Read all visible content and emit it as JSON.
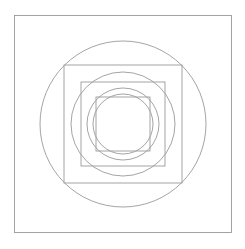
{
  "figure": {
    "background_color": "#ffffff",
    "stroke_color": "#9a9a9a",
    "stroke_width": 0.9,
    "canvas": {
      "width": 245,
      "height": 249
    },
    "center": {
      "x": 123,
      "y": 124
    }
  },
  "chart_data": {
    "type": "diagram",
    "xlabel": "",
    "ylabel": "",
    "grid": false,
    "legend": false,
    "center": {
      "x": 123,
      "y": 124
    },
    "shapes": [
      {
        "index": 1,
        "type": "square",
        "half_size": 108.5,
        "side": 217,
        "left": 14.5,
        "top": 15.5,
        "right": 231.5,
        "bottom": 232.5,
        "stroke": "#9a9a9a"
      },
      {
        "index": 2,
        "type": "circle",
        "radius": 83,
        "left": 40,
        "top": 41,
        "right": 206,
        "bottom": 207,
        "stroke": "#9a9a9a"
      },
      {
        "index": 3,
        "type": "square",
        "half_size": 59,
        "side": 118,
        "left": 64,
        "top": 65,
        "right": 182,
        "bottom": 183,
        "stroke": "#9a9a9a"
      },
      {
        "index": 4,
        "type": "circle",
        "radius": 52,
        "left": 71,
        "top": 72,
        "right": 175,
        "bottom": 176,
        "stroke": "#9a9a9a"
      },
      {
        "index": 5,
        "type": "square",
        "half_size": 42,
        "side": 84,
        "left": 81,
        "top": 82,
        "right": 165,
        "bottom": 166,
        "stroke": "#9a9a9a"
      },
      {
        "index": 6,
        "type": "circle",
        "radius": 36,
        "left": 87,
        "top": 88,
        "right": 159,
        "bottom": 160,
        "stroke": "#9a9a9a"
      },
      {
        "index": 7,
        "type": "square",
        "half_size": 27,
        "side": 54,
        "left": 96,
        "top": 97,
        "right": 150,
        "bottom": 151,
        "stroke": "#9a9a9a"
      },
      {
        "index": 8,
        "type": "circle",
        "radius": 30,
        "left": 93,
        "top": 94,
        "right": 153,
        "bottom": 154,
        "stroke": "#9a9a9a"
      }
    ],
    "shape_count": 8,
    "square_count": 4,
    "circle_count": 4
  }
}
